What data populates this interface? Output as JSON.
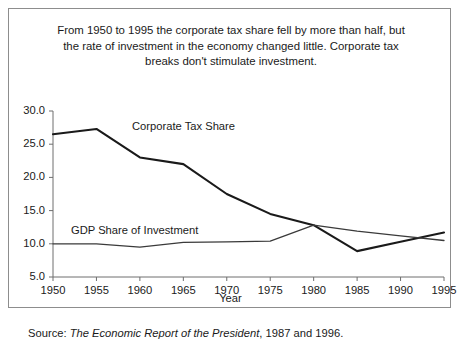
{
  "top_fragment": ". .  .   ..",
  "figure": {
    "caption": "From 1950 to 1995 the corporate tax share fell by more than half, but the rate of investment in the economy changed little. Corporate tax breaks don't stimulate investment.",
    "source_prefix": "Source:",
    "source_work": "The Economic Report of the President",
    "source_suffix": ", 1987 and 1996."
  },
  "chart_data": {
    "type": "line",
    "title": "",
    "xlabel": "Year",
    "ylabel": "",
    "x": [
      1950,
      1955,
      1960,
      1965,
      1970,
      1975,
      1980,
      1985,
      1990,
      1995
    ],
    "xtick_labels": [
      "1950",
      "1955",
      "1960",
      "1965",
      "1970",
      "1975",
      "1980",
      "1985",
      "1990",
      "1995"
    ],
    "ytick_labels": [
      "30.0",
      "25.0",
      "20.0",
      "15.0",
      "10.0",
      "5.0"
    ],
    "yticks": [
      30.0,
      25.0,
      20.0,
      15.0,
      10.0,
      5.0
    ],
    "xlim": [
      1950,
      1995
    ],
    "ylim": [
      5.0,
      30.0
    ],
    "grid": false,
    "legend": "inline-labels",
    "series": [
      {
        "name": "Corporate Tax Share",
        "color": "#1a1a1a",
        "width": 2.1,
        "values": [
          26.5,
          27.3,
          23.0,
          22.0,
          17.5,
          14.5,
          12.8,
          8.9,
          10.3,
          11.7
        ]
      },
      {
        "name": "GDP Share of Investment",
        "color": "#3a3a3a",
        "width": 1.3,
        "values": [
          10.0,
          10.0,
          9.5,
          10.2,
          10.3,
          10.4,
          12.8,
          11.9,
          11.2,
          10.5
        ]
      }
    ]
  }
}
